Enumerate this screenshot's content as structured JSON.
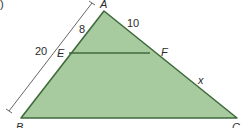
{
  "figure": {
    "part_label": ")",
    "colors": {
      "fill": "#a7cb9f",
      "stroke": "#3f6b3c",
      "text": "#2b2b2b",
      "dimension": "#555555"
    },
    "vertices": {
      "A": {
        "label": "A",
        "x": 104,
        "y": 11
      },
      "B": {
        "label": "B",
        "x": 21,
        "y": 118
      },
      "C": {
        "label": "C",
        "x": 237,
        "y": 118
      },
      "E": {
        "label": "E",
        "x": 69,
        "y": 53
      },
      "F": {
        "label": "F",
        "x": 150,
        "y": 53
      }
    },
    "measures": {
      "AE": "8",
      "AF": "10",
      "AB": "20",
      "FC": "x"
    }
  }
}
